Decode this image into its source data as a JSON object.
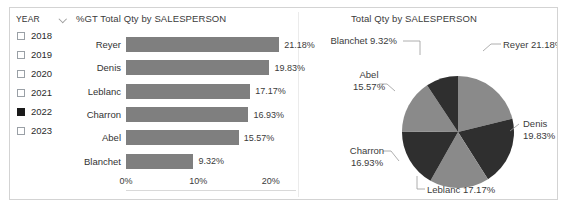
{
  "slicer": {
    "title": "YEAR",
    "dropdown_icon": "chevron-down-icon",
    "items": [
      {
        "label": "2018",
        "checked": false
      },
      {
        "label": "2019",
        "checked": false
      },
      {
        "label": "2020",
        "checked": false
      },
      {
        "label": "2021",
        "checked": false
      },
      {
        "label": "2022",
        "checked": true
      },
      {
        "label": "2023",
        "checked": false
      }
    ]
  },
  "bar_visual": {
    "title": "%GT Total Qty by SALESPERSON"
  },
  "pie_visual": {
    "title": "Total Qty by SALESPERSON"
  },
  "colors": {
    "bar_fill": "#7f7f7f",
    "pie_light": "#8a8a8a",
    "pie_dark": "#2f2f2f",
    "axis_line": "#d9d9d9",
    "panel_border": "#d3d3d3",
    "checkbox_checked": "#1a1a1a"
  },
  "chart_data": [
    {
      "type": "bar",
      "orientation": "horizontal",
      "title": "%GT Total Qty by SALESPERSON",
      "xlabel": "",
      "ylabel": "",
      "categories": [
        "Reyer",
        "Denis",
        "Leblanc",
        "Charron",
        "Abel",
        "Blanchet"
      ],
      "values": [
        21.18,
        19.83,
        17.17,
        16.93,
        15.57,
        9.32
      ],
      "value_labels": [
        "21.18%",
        "19.83%",
        "17.17%",
        "16.93%",
        "15.57%",
        "9.32%"
      ],
      "xlim": [
        0,
        23.5
      ],
      "xticks": [
        0,
        10,
        20
      ],
      "xtick_labels": [
        "0%",
        "10%",
        "20%"
      ],
      "grid": false,
      "legend": "none",
      "series_color": "#7f7f7f"
    },
    {
      "type": "pie",
      "title": "Total Qty by SALESPERSON",
      "labels": [
        "Reyer",
        "Denis",
        "Leblanc",
        "Charron",
        "Abel",
        "Blanchet"
      ],
      "values": [
        21.18,
        19.83,
        17.17,
        16.93,
        15.57,
        9.32
      ],
      "slice_labels": [
        "Reyer 21.18%",
        "Denis 19.83%",
        "Leblanc 17.17%",
        "Charron 16.93%",
        "Abel 15.57%",
        "Blanchet 9.32%"
      ],
      "slice_label_lines": [
        [
          "Reyer 21.18%"
        ],
        [
          "Denis",
          "19.83%"
        ],
        [
          "Leblanc 17.17%"
        ],
        [
          "Charron",
          "16.93%"
        ],
        [
          "Abel",
          "15.57%"
        ],
        [
          "Blanchet 9.32%"
        ]
      ],
      "slice_colors": [
        "#8a8a8a",
        "#2f2f2f",
        "#8a8a8a",
        "#2f2f2f",
        "#8a8a8a",
        "#2f2f2f"
      ],
      "legend": "none",
      "labels_position": "outside-with-leader-lines",
      "start_angle_deg": 0,
      "direction": "clockwise"
    }
  ]
}
